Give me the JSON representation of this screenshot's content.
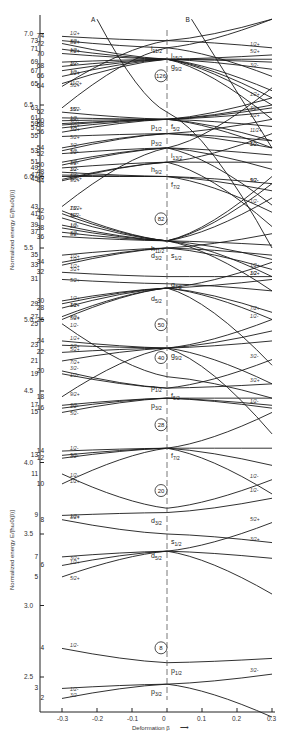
{
  "chart_data": {
    "type": "line",
    "xlabel": "Deformation β",
    "ylabel": "Normalized energy E/[ħω0(β)]",
    "xlim": [
      -0.3,
      0.3
    ],
    "ylim": [
      2.25,
      7.15
    ],
    "x_ticks": [
      "-0.3",
      "-0.2",
      "-0.1",
      "0",
      "0.1",
      "0.2",
      "0.3"
    ],
    "y_ticks": [
      "2.5",
      "3.0",
      "3.5",
      "4.0",
      "4.5",
      "5.0",
      "5.5",
      "6.0",
      "6.5",
      "7.0"
    ],
    "grid": false,
    "magic_numbers": [
      {
        "n": "8",
        "E": 2.62
      },
      {
        "n": "20",
        "E": 3.72
      },
      {
        "n": "28",
        "E": 4.18
      },
      {
        "n": "40",
        "E": 4.65
      },
      {
        "n": "50",
        "E": 4.88
      },
      {
        "n": "82",
        "E": 5.62
      },
      {
        "n": "126",
        "E": 6.62
      }
    ],
    "spherical_orbitals": [
      {
        "label": "p3/2",
        "E": 2.45
      },
      {
        "label": "p1/2",
        "E": 2.6
      },
      {
        "label": "d5/2",
        "E": 3.4
      },
      {
        "label": "s1/2",
        "E": 3.5
      },
      {
        "label": "d3/2",
        "E": 3.65
      },
      {
        "label": "f7/2",
        "E": 4.1
      },
      {
        "label": "p3/2",
        "E": 4.45
      },
      {
        "label": "f5/2",
        "E": 4.52
      },
      {
        "label": "p1/2",
        "E": 4.58
      },
      {
        "label": "g9/2",
        "E": 4.8
      },
      {
        "label": "d5/2",
        "E": 5.2
      },
      {
        "label": "g7/2",
        "E": 5.3
      },
      {
        "label": "d3/2",
        "E": 5.5
      },
      {
        "label": "s1/2",
        "E": 5.5
      },
      {
        "label": "h11/2",
        "E": 5.55
      },
      {
        "label": "f7/2",
        "E": 6.0
      },
      {
        "label": "h9/2",
        "E": 6.1
      },
      {
        "label": "i13/2",
        "E": 6.2
      },
      {
        "label": "p3/2",
        "E": 6.3
      },
      {
        "label": "f5/2",
        "E": 6.4
      },
      {
        "label": "p1/2",
        "E": 6.4
      },
      {
        "label": "g9/2",
        "E": 6.82
      },
      {
        "label": "i11/2",
        "E": 6.95
      },
      {
        "label": "j15/2",
        "E": 6.9
      }
    ],
    "series": [
      {
        "name": "2",
        "K": "3/2-",
        "x": [
          -0.3,
          0,
          0.3
        ],
        "y": [
          2.35,
          2.45,
          2.52
        ]
      },
      {
        "name": "3",
        "K": "1/2-",
        "x": [
          -0.3,
          0,
          0.3
        ],
        "y": [
          2.42,
          2.45,
          2.22
        ]
      },
      {
        "name": "4",
        "K": "1/2-",
        "x": [
          -0.3,
          0,
          0.3
        ],
        "y": [
          2.7,
          2.6,
          2.63
        ]
      },
      {
        "name": "5",
        "K": "5/2+",
        "x": [
          -0.3,
          0,
          0.3
        ],
        "y": [
          3.2,
          3.38,
          3.58
        ]
      },
      {
        "name": "6",
        "K": "1/2+",
        "x": [
          -0.3,
          0,
          0.3
        ],
        "y": [
          3.28,
          3.38,
          3.08
        ]
      },
      {
        "name": "7",
        "K": "3/2+",
        "x": [
          -0.3,
          0,
          0.3
        ],
        "y": [
          3.34,
          3.38,
          3.33
        ]
      },
      {
        "name": "8",
        "K": "3/2+",
        "x": [
          -0.3,
          0,
          0.3
        ],
        "y": [
          3.6,
          3.5,
          3.44
        ]
      },
      {
        "name": "9",
        "K": "1/2+",
        "x": [
          -0.3,
          0,
          0.3
        ],
        "y": [
          3.63,
          3.65,
          3.75
        ]
      },
      {
        "name": "10",
        "K": "1/2+",
        "x": [
          -0.3,
          0,
          0.3
        ],
        "y": [
          3.85,
          4.1,
          4.35
        ]
      },
      {
        "name": "11",
        "K": "1/2-",
        "x": [
          -0.3,
          0,
          0.3
        ],
        "y": [
          3.92,
          3.68,
          3.88
        ]
      },
      {
        "name": "12",
        "K": "5/2-",
        "x": [
          -0.3,
          0,
          0.3
        ],
        "y": [
          4.03,
          4.1,
          3.98
        ]
      },
      {
        "name": "13",
        "K": "3/2-",
        "x": [
          -0.3,
          0,
          0.3
        ],
        "y": [
          4.05,
          4.1,
          4.1
        ]
      },
      {
        "name": "14",
        "K": "1/2-",
        "x": [
          -0.3,
          0,
          0.3
        ],
        "y": [
          4.08,
          4.1,
          3.78
        ]
      },
      {
        "name": "15",
        "K": "5/2-",
        "x": [
          -0.3,
          0,
          0.3
        ],
        "y": [
          4.35,
          4.45,
          4.38
        ]
      },
      {
        "name": "16",
        "K": "3/2-",
        "x": [
          -0.3,
          0,
          0.3
        ],
        "y": [
          4.38,
          4.45,
          4.45
        ]
      },
      {
        "name": "17",
        "K": "1/2-",
        "x": [
          -0.3,
          0,
          0.3
        ],
        "y": [
          4.4,
          4.45,
          4.4
        ]
      },
      {
        "name": "18",
        "K": "9/2+",
        "x": [
          -0.3,
          0,
          0.3
        ],
        "y": [
          4.46,
          4.8,
          5.0
        ]
      },
      {
        "name": "19",
        "K": "1/2-",
        "x": [
          -0.3,
          0,
          0.3
        ],
        "y": [
          4.62,
          4.52,
          4.55
        ]
      },
      {
        "name": "20",
        "K": "3/2-",
        "x": [
          -0.3,
          0,
          0.3
        ],
        "y": [
          4.64,
          4.52,
          4.72
        ]
      },
      {
        "name": "21",
        "K": "7/2+",
        "x": [
          -0.3,
          0,
          0.3
        ],
        "y": [
          4.71,
          4.8,
          4.85
        ]
      },
      {
        "name": "22",
        "K": "5/2+",
        "x": [
          -0.3,
          0,
          0.3
        ],
        "y": [
          4.77,
          4.8,
          4.92
        ]
      },
      {
        "name": "23",
        "K": "3/2+",
        "x": [
          -0.3,
          0,
          0.3
        ],
        "y": [
          4.82,
          4.8,
          4.55
        ]
      },
      {
        "name": "24",
        "K": "1/2+",
        "x": [
          -0.3,
          0,
          0.3
        ],
        "y": [
          4.85,
          4.8,
          4.2
        ]
      },
      {
        "name": "25",
        "K": "1/2-",
        "x": [
          -0.3,
          0,
          0.3
        ],
        "y": [
          4.97,
          4.6,
          4.45
        ]
      },
      {
        "name": "26",
        "K": "7/2+",
        "x": [
          -0.3,
          0,
          0.3
        ],
        "y": [
          5.0,
          5.22,
          5.05
        ]
      },
      {
        "name": "27",
        "K": "5/2+",
        "x": [
          -0.3,
          0,
          0.3
        ],
        "y": [
          5.02,
          5.22,
          5.4
        ]
      },
      {
        "name": "28",
        "K": "3/2+",
        "x": [
          -0.3,
          0,
          0.3
        ],
        "y": [
          5.08,
          5.22,
          5.28
        ]
      },
      {
        "name": "29",
        "K": "1/2-",
        "x": [
          -0.3,
          0,
          0.3
        ],
        "y": [
          5.11,
          5.22,
          5.0
        ]
      },
      {
        "name": "30",
        "K": "1/2+",
        "x": [
          -0.3,
          0,
          0.3
        ],
        "y": [
          5.13,
          5.22,
          4.68
        ]
      },
      {
        "name": "31",
        "K": "5/2+",
        "x": [
          -0.3,
          0,
          0.3
        ],
        "y": [
          5.28,
          5.25,
          5.2
        ]
      },
      {
        "name": "32",
        "K": "3/2+",
        "x": [
          -0.3,
          0,
          0.3
        ],
        "y": [
          5.33,
          5.3,
          5.3
        ]
      },
      {
        "name": "33",
        "K": "1/2+",
        "x": [
          -0.3,
          0,
          0.3
        ],
        "y": [
          5.38,
          5.5,
          5.45
        ]
      },
      {
        "name": "34",
        "K": "1/2+",
        "x": [
          -0.3,
          0,
          0.3
        ],
        "y": [
          5.4,
          5.5,
          5.6
        ]
      },
      {
        "name": "35",
        "K": "1/2+",
        "x": [
          -0.3,
          0,
          0.3
        ],
        "y": [
          5.45,
          5.5,
          5.35
        ]
      },
      {
        "name": "36",
        "K": "5/2-",
        "x": [
          -0.3,
          0,
          0.3
        ],
        "y": [
          5.58,
          5.55,
          5.52
        ]
      },
      {
        "name": "37",
        "K": "3/2-",
        "x": [
          -0.3,
          0,
          0.3
        ],
        "y": [
          5.61,
          5.55,
          5.42
        ]
      },
      {
        "name": "38",
        "K": "1/2-",
        "x": [
          -0.3,
          0,
          0.3
        ],
        "y": [
          5.64,
          5.55,
          5.3
        ]
      },
      {
        "name": "39",
        "K": "1/2-",
        "x": [
          -0.3,
          0,
          0.3
        ],
        "y": [
          5.66,
          5.55,
          5.2
        ]
      },
      {
        "name": "40",
        "K": "11/2-",
        "x": [
          -0.3,
          0,
          0.3
        ],
        "y": [
          5.71,
          5.55,
          5.85
        ]
      },
      {
        "name": "41",
        "K": "9/2-",
        "x": [
          -0.3,
          0,
          0.3
        ],
        "y": [
          5.74,
          5.55,
          5.95
        ]
      },
      {
        "name": "42",
        "K": "7/2-",
        "x": [
          -0.3,
          0,
          0.3
        ],
        "y": [
          5.76,
          5.55,
          6.0
        ]
      },
      {
        "name": "43",
        "K": "13/2+",
        "x": [
          -0.3,
          0,
          0.3
        ],
        "y": [
          5.79,
          6.2,
          6.62
        ]
      },
      {
        "name": "44",
        "K": "11/2+",
        "x": [
          -0.3,
          0,
          0.3
        ],
        "y": [
          5.97,
          6.1,
          6.3
        ]
      },
      {
        "name": "45",
        "K": "9/2+",
        "x": [
          -0.3,
          0,
          0.3
        ],
        "y": [
          5.98,
          6.1,
          6.1
        ]
      },
      {
        "name": "46",
        "K": "7/2-",
        "x": [
          -0.3,
          0,
          0.3
        ],
        "y": [
          6.0,
          6.0,
          5.9
        ]
      },
      {
        "name": "47",
        "K": "5/2-",
        "x": [
          -0.3,
          0,
          0.3
        ],
        "y": [
          6.01,
          6.0,
          5.95
        ]
      },
      {
        "name": "48",
        "K": "3/2-",
        "x": [
          -0.3,
          0,
          0.3
        ],
        "y": [
          6.03,
          6.0,
          5.75
        ]
      },
      {
        "name": "49",
        "K": "1/2-",
        "x": [
          -0.3,
          0,
          0.3
        ],
        "y": [
          6.06,
          6.1,
          5.65
        ]
      },
      {
        "name": "50",
        "K": "1/2-",
        "x": [
          -0.3,
          0,
          0.3
        ],
        "y": [
          6.08,
          6.2,
          5.8
        ]
      },
      {
        "name": "51",
        "K": "3/2-",
        "x": [
          -0.3,
          0,
          0.3
        ],
        "y": [
          6.1,
          6.2,
          6.05
        ]
      },
      {
        "name": "52",
        "K": "5/2-",
        "x": [
          -0.3,
          0,
          0.3
        ],
        "y": [
          6.16,
          6.2,
          6.15
        ]
      },
      {
        "name": "53",
        "K": "1/2-",
        "x": [
          -0.3,
          0,
          0.3
        ],
        "y": [
          6.18,
          6.3,
          6.2
        ]
      },
      {
        "name": "54",
        "K": "3/2-",
        "x": [
          -0.3,
          0,
          0.3
        ],
        "y": [
          6.2,
          6.3,
          6.25
        ]
      },
      {
        "name": "55",
        "K": "5/2+",
        "x": [
          -0.3,
          0,
          0.3
        ],
        "y": [
          6.28,
          6.3,
          6.4
        ]
      },
      {
        "name": "56",
        "K": "3/2+",
        "x": [
          -0.3,
          0,
          0.3
        ],
        "y": [
          6.31,
          6.4,
          6.45
        ]
      },
      {
        "name": "57",
        "K": "1/2+",
        "x": [
          -0.3,
          0,
          0.3
        ],
        "y": [
          6.34,
          6.4,
          6.35
        ]
      },
      {
        "name": "58",
        "K": "3/2+",
        "x": [
          -0.3,
          0,
          0.3
        ],
        "y": [
          6.36,
          6.4,
          6.5
        ]
      },
      {
        "name": "59",
        "K": "1/2+",
        "x": [
          -0.3,
          0,
          0.3
        ],
        "y": [
          6.37,
          6.4,
          6.55
        ]
      },
      {
        "name": "60",
        "K": "1/2-",
        "x": [
          -0.3,
          0,
          0.3
        ],
        "y": [
          6.39,
          6.4,
          6.48
        ]
      },
      {
        "name": "61",
        "K": "3/2-",
        "x": [
          -0.3,
          0,
          0.3
        ],
        "y": [
          6.41,
          6.4,
          6.25
        ]
      },
      {
        "name": "62",
        "K": "5/2-",
        "x": [
          -0.3,
          0,
          0.3
        ],
        "y": [
          6.45,
          6.4,
          6.2
        ]
      },
      {
        "name": "63",
        "K": "15/2-",
        "x": [
          -0.3,
          0,
          0.3
        ],
        "y": [
          6.48,
          6.9,
          7.1
        ]
      },
      {
        "name": "64",
        "K": "11/2+",
        "x": [
          -0.3,
          0,
          0.3
        ],
        "y": [
          6.63,
          6.95,
          7.1
        ]
      },
      {
        "name": "65",
        "K": "5/2+",
        "x": [
          -0.3,
          0,
          0.3
        ],
        "y": [
          6.65,
          6.82,
          6.85
        ]
      },
      {
        "name": "66",
        "K": "3/2+",
        "x": [
          -0.3,
          0,
          0.3
        ],
        "y": [
          6.7,
          6.82,
          6.8
        ]
      },
      {
        "name": "67",
        "K": "1/2+",
        "x": [
          -0.3,
          0,
          0.3
        ],
        "y": [
          6.74,
          6.82,
          6.6
        ]
      },
      {
        "name": "68",
        "K": "3/2-",
        "x": [
          -0.3,
          0,
          0.3
        ],
        "y": [
          6.77,
          6.82,
          6.75
        ]
      },
      {
        "name": "69",
        "K": "1/2-",
        "x": [
          -0.3,
          0,
          0.3
        ],
        "y": [
          6.8,
          6.82,
          6.5
        ]
      },
      {
        "name": "70",
        "K": "7/2+",
        "x": [
          -0.3,
          0,
          0.3
        ],
        "y": [
          6.86,
          6.82,
          6.82
        ]
      },
      {
        "name": "71",
        "K": "1/2+",
        "x": [
          -0.3,
          0,
          0.3
        ],
        "y": [
          6.89,
          6.82,
          6.4
        ]
      },
      {
        "name": "72",
        "K": "3/2+",
        "x": [
          -0.3,
          0,
          0.3
        ],
        "y": [
          6.93,
          6.82,
          6.55
        ]
      },
      {
        "name": "73",
        "K": "5/2+",
        "x": [
          -0.3,
          0,
          0.3
        ],
        "y": [
          6.95,
          6.9,
          6.7
        ]
      },
      {
        "name": "74",
        "K": "1/2+",
        "x": [
          -0.3,
          0,
          0.3
        ],
        "y": [
          6.98,
          6.95,
          6.9
        ]
      },
      {
        "name": "A",
        "K": "1/2-",
        "x": [
          -0.2,
          0,
          0.3
        ],
        "y": [
          7.1,
          6.45,
          5.5
        ]
      },
      {
        "name": "B",
        "K": "1/2+",
        "x": [
          0.07,
          0.3
        ],
        "y": [
          7.1,
          6.2
        ]
      }
    ]
  },
  "labels": {
    "xlabel": "Deformation β",
    "ylabel_upper": "Normalized energy E/[ħω0(β)]",
    "ylabel_lower": "Normalized energy E/[ħω0(β)]"
  }
}
